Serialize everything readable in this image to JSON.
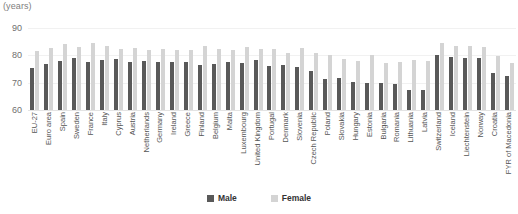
{
  "units_label": "(years)",
  "legend": {
    "male_label": "Male",
    "female_label": "Female",
    "male_color": "#595959",
    "female_color": "#d4d4d4",
    "position": "bottom-center"
  },
  "chart_data": {
    "type": "bar",
    "title": "",
    "subtitle": "",
    "xlabel": "",
    "ylabel": "(years)",
    "ylim": [
      60,
      90
    ],
    "yticks": [
      60,
      70,
      80,
      90
    ],
    "ytick_labels": [
      "60",
      "70",
      "80",
      "90"
    ],
    "grid": true,
    "grid_axis": "y",
    "legend_entries": [
      "Male",
      "Female"
    ],
    "categories": [
      "EU-27",
      "Euro area",
      "Spain",
      "Sweden",
      "France",
      "Italy",
      "Cyprus",
      "Austria",
      "Netherlands",
      "Germany",
      "Ireland",
      "Greece",
      "Finland",
      "Belgium",
      "Malta",
      "Luxembourg",
      "United Kingdom",
      "Portugal",
      "Denmark",
      "Slovenia",
      "Czech Republic",
      "Poland",
      "Slovakia",
      "Hungary",
      "Estonia",
      "Bulgaria",
      "Romania",
      "Lithuania",
      "Latvia",
      "Switzerland",
      "Iceland",
      "Liechtenstein",
      "Norway",
      "Croatia",
      "FYR of Macedonia"
    ],
    "series": [
      {
        "name": "Male",
        "color": "#595959",
        "values": [
          75.3,
          76.8,
          77.9,
          79.1,
          77.5,
          78.3,
          78.8,
          77.4,
          78.0,
          77.4,
          77.4,
          77.5,
          76.3,
          77.0,
          77.4,
          77.2,
          78.2,
          76.2,
          76.5,
          75.8,
          74.3,
          71.5,
          71.6,
          70.4,
          69.8,
          69.8,
          69.4,
          67.5,
          67.4,
          80.3,
          79.5,
          79.2,
          79.0,
          73.4,
          72.6
        ]
      },
      {
        "name": "Female",
        "color": "#d4d4d4",
        "values": [
          81.6,
          82.7,
          84.3,
          83.2,
          84.4,
          83.6,
          82.4,
          82.7,
          82.0,
          82.4,
          82.0,
          82.1,
          83.3,
          82.3,
          82.1,
          83.0,
          82.2,
          82.4,
          80.8,
          82.7,
          80.7,
          80.2,
          78.7,
          78.1,
          80.1,
          77.2,
          77.5,
          78.2,
          77.8,
          84.7,
          83.6,
          83.4,
          83.2,
          79.8,
          77.2
        ]
      }
    ]
  }
}
